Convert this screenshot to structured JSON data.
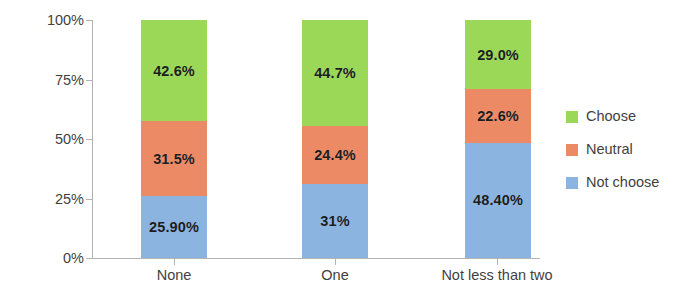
{
  "chart_data": {
    "type": "bar",
    "stacked": true,
    "stack_total": 100,
    "title": "",
    "subtitle": "",
    "xlabel": "",
    "ylabel": "",
    "ylim": [
      0,
      100
    ],
    "grid": false,
    "legend_position": "right",
    "categories": [
      "None",
      "One",
      "Not less than two"
    ],
    "y_ticks": [
      0,
      25,
      50,
      75,
      100
    ],
    "y_tick_labels": [
      "0%",
      "25%",
      "50%",
      "75%",
      "100%"
    ],
    "series": [
      {
        "name": "Not choose",
        "color": "#8CB4E0",
        "values": [
          25.9,
          31.0,
          48.4
        ],
        "labels": [
          "25.90%",
          "31%",
          "48.40%"
        ]
      },
      {
        "name": "Neutral",
        "color": "#EC8A66",
        "values": [
          31.5,
          24.4,
          22.6
        ],
        "labels": [
          "31.5%",
          "24.4%",
          "22.6%"
        ]
      },
      {
        "name": "Choose",
        "color": "#9BD857",
        "values": [
          42.6,
          44.7,
          29.0
        ],
        "labels": [
          "42.6%",
          "44.7%",
          "29.0%"
        ]
      }
    ]
  },
  "legend": {
    "items": [
      {
        "label": "Choose",
        "color": "#9BD857"
      },
      {
        "label": "Neutral",
        "color": "#EC8A66"
      },
      {
        "label": "Not choose",
        "color": "#8CB4E0"
      }
    ]
  },
  "axis": {
    "y_tick_labels": [
      "100%",
      "75%",
      "50%",
      "25%",
      "0%"
    ],
    "x_category_labels": [
      "None",
      "One",
      "Not less than two"
    ]
  }
}
